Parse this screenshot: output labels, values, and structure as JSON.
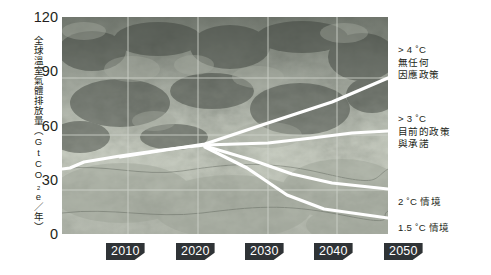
{
  "chart_data": {
    "type": "line",
    "title": "",
    "xlabel": "",
    "ylabel": "全球溫室氣體排放量（GtCO₂e／年）",
    "xlim": [
      2005,
      2050
    ],
    "ylim": [
      0,
      120
    ],
    "grid": true,
    "legend_position": "right-inline-labels",
    "xticks": [
      "2010",
      "2020",
      "2030",
      "2040",
      "2050"
    ],
    "yticks": [
      "0",
      "30",
      "60",
      "90",
      "120"
    ],
    "series": [
      {
        "name": ">4°C 無任何因應政策",
        "label_line1": "> 4 ˚C",
        "label_line2": "無任何",
        "label_line3": "因應政策",
        "x": [
          2005,
          2008,
          2012,
          2020,
          2030,
          2040,
          2050
        ],
        "values": [
          47,
          46,
          50,
          54,
          58,
          74,
          90
        ]
      },
      {
        "name": ">3°C 目前的政策與承諾",
        "label_line1": "> 3 ˚C",
        "label_line2": "目前的政策",
        "label_line3": "與承諾",
        "x": [
          2005,
          2008,
          2012,
          2020,
          2030,
          2040,
          2050
        ],
        "values": [
          47,
          46,
          49,
          53,
          57,
          60,
          62
        ]
      },
      {
        "name": "2°C 情境",
        "label_line1": "2 ˚C 情境",
        "label_line2": "",
        "label_line3": "",
        "x": [
          2005,
          2008,
          2012,
          2020,
          2030,
          2040,
          2050
        ],
        "values": [
          47,
          46,
          49,
          53,
          57,
          41,
          31
        ]
      },
      {
        "name": "1.5°C 情境",
        "label_line1": "1.5 ˚C 情境",
        "label_line2": "",
        "label_line3": "",
        "x": [
          2005,
          2008,
          2012,
          2020,
          2030,
          2040,
          2050
        ],
        "values": [
          47,
          46,
          49,
          53,
          57,
          26,
          8
        ]
      }
    ]
  },
  "yaxis": {
    "title": "全球溫室氣體排放量（GtCO₂e／年）",
    "ticks": [
      {
        "label": "120",
        "value": 120
      },
      {
        "label": "90",
        "value": 90
      },
      {
        "label": "60",
        "value": 60
      },
      {
        "label": "30",
        "value": 30
      },
      {
        "label": "0",
        "value": 0
      }
    ]
  },
  "xaxis": {
    "ticks": [
      {
        "label": "2010"
      },
      {
        "label": "2020"
      },
      {
        "label": "2030"
      },
      {
        "label": "2040"
      },
      {
        "label": "2050"
      }
    ]
  },
  "annotations": [
    {
      "line1": "> 4 ˚C",
      "line2": "無任何",
      "line3": "因應政策"
    },
    {
      "line1": "> 3 ˚C",
      "line2": "目前的政策",
      "line3": "與承諾"
    },
    {
      "line1": "2 ˚C 情境",
      "line2": "",
      "line3": ""
    },
    {
      "line1": "1.5 ˚C 情境",
      "line2": "",
      "line3": ""
    }
  ],
  "colors": {
    "line": "#ffffff",
    "grid": "#cfd3cb",
    "chip_bg": "#2f3336",
    "chip_text": "#ffffff",
    "text": "#231f20",
    "plot_bg": "#6e736b"
  }
}
